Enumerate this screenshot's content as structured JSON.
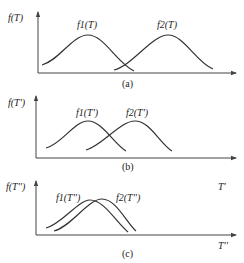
{
  "panels": [
    {
      "id": "a",
      "caption": "(a)",
      "y_label": "f(T)",
      "curve1_label": "f1(T)",
      "curve2_label": "f2(T)",
      "description": "Two well-separated bell-shaped distributions; overlap only at tails"
    },
    {
      "id": "b",
      "caption": "(b)",
      "y_label": "f(T')",
      "curve1_label": "f1(T')",
      "curve2_label": "f2(T')",
      "description": "Two bell-shaped distributions moved closer, intersecting near mid-height"
    },
    {
      "id": "c",
      "caption": "(c)",
      "y_label": "f(T'')",
      "curve1_label": "f1(T'')",
      "curve2_label": "f2(T'')",
      "x_label": "T''",
      "extra_label": "T'",
      "description": "Two bell-shaped distributions largely overlapping"
    }
  ],
  "colors": {
    "line": "#333333",
    "axis": "#444444",
    "background": "#ffffff"
  }
}
